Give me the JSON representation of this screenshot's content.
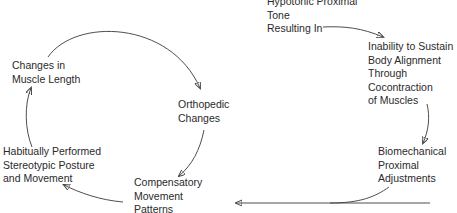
{
  "diagram": {
    "type": "cycle-flow",
    "nodes": [
      {
        "id": "hypotonic",
        "lines": [
          "Hypotonic Proximal",
          "Tone",
          "Resulting In"
        ]
      },
      {
        "id": "inability",
        "lines": [
          "Inability to Sustain",
          "Body Alignment",
          "Through",
          "Cocontraction",
          "of Muscles"
        ]
      },
      {
        "id": "biomechanical",
        "lines": [
          "Biomechanical",
          "Proximal",
          "Adjustments"
        ]
      },
      {
        "id": "compensatory",
        "lines": [
          "Compensatory",
          "Movement",
          "Patterns"
        ]
      },
      {
        "id": "habitual",
        "lines": [
          "Habitually Performed",
          "Stereotypic Posture",
          "and Movement"
        ]
      },
      {
        "id": "muscle-length",
        "lines": [
          "Changes in",
          "Muscle Length"
        ]
      },
      {
        "id": "orthopedic",
        "lines": [
          "Orthopedic",
          "Changes"
        ]
      }
    ],
    "edges": [
      {
        "from": "hypotonic",
        "to": "inability"
      },
      {
        "from": "inability",
        "to": "biomechanical"
      },
      {
        "from": "biomechanical",
        "to": "compensatory"
      },
      {
        "from": "compensatory",
        "to": "habitual"
      },
      {
        "from": "habitual",
        "to": "muscle-length"
      },
      {
        "from": "muscle-length",
        "to": "orthopedic"
      },
      {
        "from": "orthopedic",
        "to": "compensatory"
      }
    ],
    "colors": {
      "text": "#2a2a2a",
      "line": "#3a3a3a",
      "background": "#ffffff"
    }
  }
}
